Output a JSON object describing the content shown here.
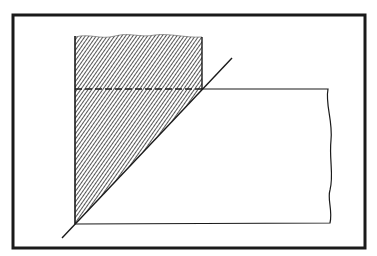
{
  "figure": {
    "colors": {
      "ink": "#1a1a1a",
      "background": "#ffffff",
      "hatch": "#2a2a2a"
    },
    "frame": {
      "x": 13,
      "y": 15,
      "width": 352,
      "height": 233,
      "stroke_width": 3
    },
    "hatched_region": {
      "left_x": 75,
      "top_y_wavy": 36,
      "right_x": 202,
      "bottom_corner": [
        75,
        224
      ]
    },
    "dashed_line": {
      "x1": 75,
      "x2": 202,
      "y": 89
    },
    "diagonal_line": {
      "x1": 62,
      "y1": 238,
      "x2": 232,
      "y2": 58
    },
    "rectangle": {
      "top_y": 89,
      "bottom_y": 223,
      "left_x": 75,
      "right_x": 330
    }
  }
}
